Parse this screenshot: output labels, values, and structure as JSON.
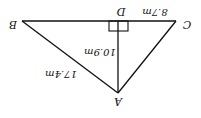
{
  "diagram": {
    "type": "right-triangle-altitude",
    "orientation": "rotated-180",
    "points": {
      "A": {
        "label": "A",
        "x": 118,
        "y": 93
      },
      "B": {
        "label": "B",
        "x": 22,
        "y": 21
      },
      "C": {
        "label": "C",
        "x": 176,
        "y": 21
      },
      "D": {
        "label": "D",
        "x": 118,
        "y": 21
      }
    },
    "segments": {
      "DC": {
        "label": "8.7m"
      },
      "AD": {
        "label": "10.9m"
      },
      "AB": {
        "label": "17.4m"
      }
    },
    "right_angle_at": "D",
    "colors": {
      "stroke": "#111111",
      "background": "#ffffff"
    }
  }
}
